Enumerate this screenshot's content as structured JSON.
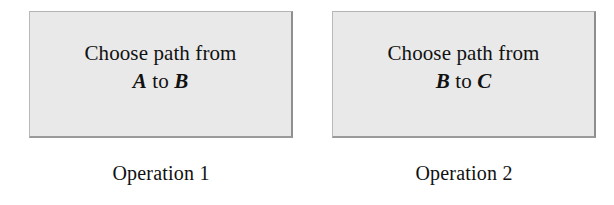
{
  "page": {
    "background_color": "#ffffff",
    "text_color": "#111111"
  },
  "operations": [
    {
      "box": {
        "fill_color": "#e9e9e9",
        "border_color": "#8f8f8f",
        "line1": "Choose path from",
        "from_node": "A",
        "connector": "to",
        "to_node": "B"
      },
      "caption": "Operation 1"
    },
    {
      "box": {
        "fill_color": "#e9e9e9",
        "border_color": "#8f8f8f",
        "line1": "Choose path from",
        "from_node": "B",
        "connector": "to",
        "to_node": "C"
      },
      "caption": "Operation 2"
    }
  ]
}
